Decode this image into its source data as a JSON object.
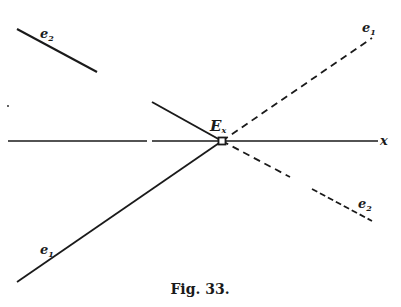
{
  "figure": {
    "caption": "Fig. 33.",
    "ink_color": "#1a1a1a",
    "background": "#ffffff"
  },
  "axis": {
    "label": "x"
  },
  "point": {
    "label": "E",
    "subscript": "x"
  },
  "lines": {
    "e1_lower": {
      "label": "e",
      "subscript": "1",
      "style": "solid"
    },
    "e1_upper": {
      "label": "e",
      "subscript": "1",
      "style": "dashed"
    },
    "e2_upper": {
      "label": "e",
      "subscript": "2",
      "style": "solid"
    },
    "e2_lower": {
      "label": "e",
      "subscript": "2",
      "style": "dashed"
    }
  }
}
